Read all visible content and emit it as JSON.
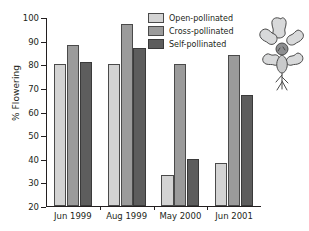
{
  "chart_data": {
    "type": "bar",
    "title": "",
    "xlabel": "",
    "ylabel": "% Flowering",
    "ylim": [
      20,
      100
    ],
    "yticks": [
      20,
      30,
      40,
      50,
      60,
      70,
      80,
      90,
      100
    ],
    "grid": false,
    "legend_position": "top-right",
    "categories": [
      "Jun 1999",
      "Aug 1999",
      "May 2000",
      "Jun 2001"
    ],
    "series": [
      {
        "name": "Open-pollinated",
        "color": "#d3d3d3",
        "values": [
          80,
          80,
          33,
          38
        ]
      },
      {
        "name": "Cross-pollinated",
        "color": "#9b9b9b",
        "values": [
          88,
          97,
          80,
          84
        ]
      },
      {
        "name": "Self-pollinated",
        "color": "#5d5d5d",
        "values": [
          81,
          87,
          40,
          67
        ]
      }
    ]
  },
  "legend": {
    "items": [
      {
        "label": "Open-pollinated"
      },
      {
        "label": "Cross-pollinated"
      },
      {
        "label": "Self-pollinated"
      }
    ]
  },
  "decoration": {
    "flower_icon": "flower-illustration"
  },
  "colors": {
    "axis": "#231f20",
    "open": "#d3d3d3",
    "cross": "#9b9b9b",
    "self": "#5d5d5d",
    "background": "#ffffff"
  }
}
